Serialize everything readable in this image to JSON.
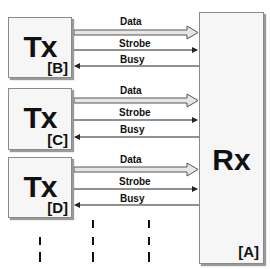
{
  "transmitters": [
    {
      "title": "Tx",
      "tag": "[B]",
      "signals": {
        "data": "Data",
        "strobe": "Strobe",
        "busy": "Busy"
      }
    },
    {
      "title": "Tx",
      "tag": "[C]",
      "signals": {
        "data": "Data",
        "strobe": "Strobe",
        "busy": "Busy"
      }
    },
    {
      "title": "Tx",
      "tag": "[D]",
      "signals": {
        "data": "Data",
        "strobe": "Strobe",
        "busy": "Busy"
      }
    }
  ],
  "receiver": {
    "title": "Rx",
    "tag": "[A]"
  },
  "colors": {
    "box_fill": "#f6f6f6",
    "box_border": "#8a8a8a",
    "line": "#222222",
    "data_arrow_fill": "#e6e6e6"
  }
}
